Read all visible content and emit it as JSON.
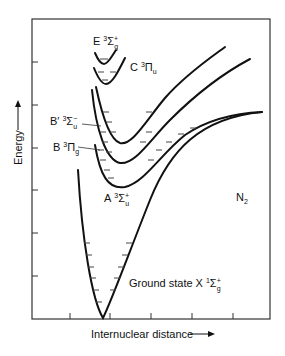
{
  "diagram": {
    "molecule": "N",
    "molecule_sub": "2",
    "y_axis_label": "Energy",
    "x_axis_label": "Internuclear distance",
    "states": [
      {
        "id": "E",
        "letter": "E",
        "mult": "3",
        "sym": "Σ",
        "sub": "g",
        "sup": "+"
      },
      {
        "id": "C",
        "letter": "C",
        "mult": "3",
        "sym": "Π",
        "sub": "u",
        "sup": ""
      },
      {
        "id": "Bprime",
        "letter": "B′",
        "mult": "3",
        "sym": "Σ",
        "sub": "u",
        "sup": "−"
      },
      {
        "id": "B",
        "letter": "B",
        "mult": "3",
        "sym": "Π",
        "sub": "g",
        "sup": ""
      },
      {
        "id": "A",
        "letter": "A",
        "mult": "3",
        "sym": "Σ",
        "sub": "u",
        "sup": "+"
      },
      {
        "id": "X",
        "prefix": "Ground state",
        "letter": "X",
        "mult": "1",
        "sym": "Σ",
        "sub": "g",
        "sup": "+"
      }
    ]
  }
}
